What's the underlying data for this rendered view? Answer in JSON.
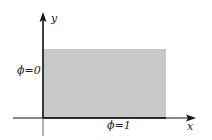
{
  "diagram": {
    "axes": {
      "x_label": "x",
      "y_label": "y"
    },
    "region": {
      "fill_color": "#c8c8c8",
      "left_boundary_label": "ϕ=0",
      "bottom_boundary_label": "ϕ=1"
    },
    "colors": {
      "axis": "#111111",
      "region": "#c8c8c8"
    }
  }
}
